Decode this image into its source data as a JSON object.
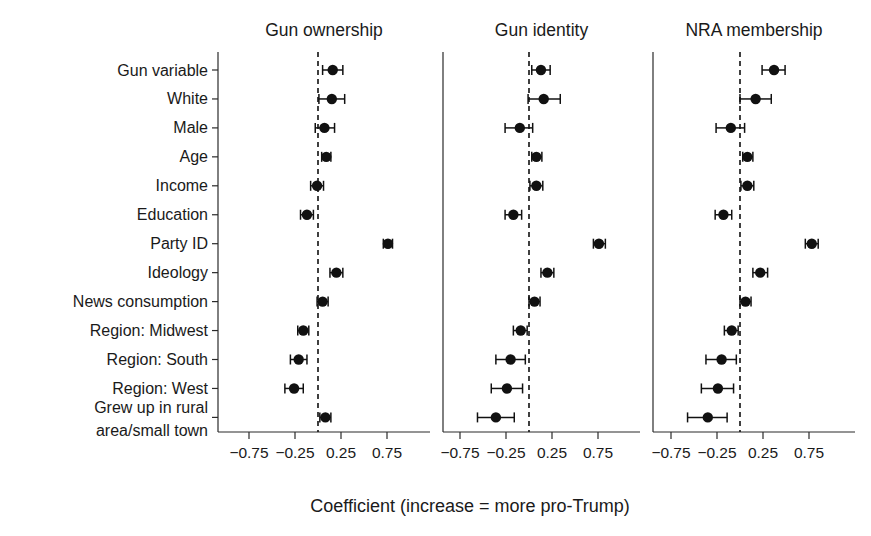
{
  "chart_data": {
    "type": "scatter",
    "subtype": "coefficient-plot-with-error-bars",
    "title": "",
    "xlabel": "Coefficient (increase = more pro-Trump)",
    "ylabel": "",
    "xlim": [
      -1.15,
      1.15
    ],
    "xticks": [
      -0.75,
      -0.25,
      0.25,
      0.75
    ],
    "xticklabels": [
      "−0.75",
      "−0.25",
      "0.25",
      "0.75"
    ],
    "grid": false,
    "legend": null,
    "reference_line": 0,
    "reference_line_style": "dashed",
    "categories": [
      "Gun variable",
      "White",
      "Male",
      "Age",
      "Income",
      "Education",
      "Party ID",
      "Ideology",
      "News consumption",
      "Region: Midwest",
      "Region: South",
      "Region: West",
      "Grew up in rural area/small town"
    ],
    "panels": [
      {
        "title": "Gun ownership",
        "estimates": [
          0.16,
          0.15,
          0.07,
          0.09,
          -0.01,
          -0.12,
          0.76,
          0.2,
          0.05,
          -0.16,
          -0.21,
          -0.26,
          0.08
        ],
        "ci_low": [
          0.05,
          0.01,
          -0.03,
          0.04,
          -0.08,
          -0.19,
          0.71,
          0.13,
          -0.01,
          -0.22,
          -0.3,
          -0.36,
          0.02
        ],
        "ci_high": [
          0.27,
          0.29,
          0.18,
          0.14,
          0.06,
          -0.05,
          0.81,
          0.27,
          0.11,
          -0.1,
          -0.12,
          -0.16,
          0.14
        ]
      },
      {
        "title": "Gun identity",
        "estimates": [
          0.13,
          0.16,
          -0.1,
          0.08,
          0.08,
          -0.17,
          0.76,
          0.2,
          0.06,
          -0.09,
          -0.2,
          -0.24,
          -0.36,
          0.01
        ],
        "ci_low": [
          0.03,
          -0.01,
          -0.26,
          0.03,
          0.01,
          -0.26,
          0.7,
          0.13,
          0.0,
          -0.17,
          -0.36,
          -0.41,
          -0.56,
          -0.07
        ],
        "ci_high": [
          0.23,
          0.34,
          0.04,
          0.14,
          0.15,
          -0.08,
          0.83,
          0.27,
          0.12,
          -0.02,
          -0.04,
          -0.07,
          -0.16,
          0.09
        ]
      },
      {
        "title": "NRA membership",
        "estimates": [
          0.37,
          0.17,
          -0.1,
          0.08,
          0.08,
          -0.18,
          0.78,
          0.22,
          0.06,
          -0.09,
          -0.2,
          -0.24,
          -0.35,
          0.01
        ],
        "ci_low": [
          0.24,
          0.0,
          -0.26,
          0.03,
          0.01,
          -0.27,
          0.71,
          0.14,
          0.0,
          -0.17,
          -0.37,
          -0.42,
          -0.57,
          -0.07
        ],
        "ci_high": [
          0.49,
          0.34,
          0.05,
          0.14,
          0.15,
          -0.09,
          0.85,
          0.3,
          0.12,
          -0.02,
          -0.04,
          -0.07,
          -0.14,
          0.09
        ]
      }
    ]
  },
  "axis": {
    "caption": "Coefficient (increase = more pro-Trump)"
  }
}
